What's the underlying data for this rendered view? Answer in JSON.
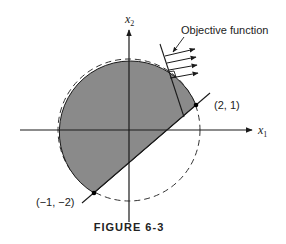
{
  "figure": {
    "caption": "FIGURE 6-3",
    "axes": {
      "x_label": "x",
      "x_sub": "1",
      "y_label": "x",
      "y_sub": "2"
    },
    "annotations": {
      "objective_label": "Objective function",
      "point_a": "(2, 1)",
      "point_b": "(−1, −2)"
    },
    "colors": {
      "region_fill": "#8a8a8a",
      "stroke": "#1a1a1a"
    }
  }
}
